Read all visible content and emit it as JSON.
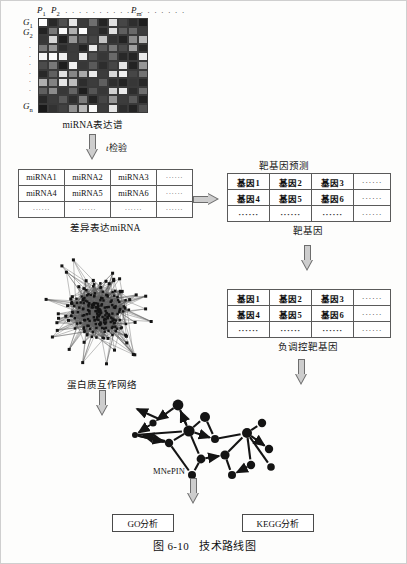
{
  "figure": {
    "caption_number": "图 6-10",
    "caption_title": "技术路线图"
  },
  "heatmap": {
    "name": "miRNA expression heatmap",
    "caption": "miRNA表达谱",
    "col_first": "P",
    "col_first_sub": "1",
    "col_second": "P",
    "col_second_sub": "2",
    "col_last": "P",
    "col_last_sub": "m",
    "row_first": "G",
    "row_first_sub": "1",
    "row_second": "G",
    "row_second_sub": "2",
    "row_last": "G",
    "row_last_sub": "n",
    "col_dots": "· · · · · · · · · · · · · · · · · ·",
    "row_dots": "·",
    "rows": 11,
    "cols": 11,
    "cells": [
      [
        255,
        40,
        80,
        230,
        60,
        110,
        35,
        225,
        70,
        45,
        30
      ],
      [
        35,
        120,
        250,
        175,
        255,
        60,
        40,
        225,
        95,
        105,
        60
      ],
      [
        55,
        215,
        30,
        150,
        90,
        70,
        195,
        50,
        35,
        140,
        185
      ],
      [
        120,
        150,
        45,
        60,
        35,
        235,
        90,
        120,
        75,
        160,
        40
      ],
      [
        245,
        250,
        240,
        60,
        235,
        80,
        55,
        105,
        40,
        35,
        235
      ],
      [
        75,
        120,
        30,
        240,
        55,
        90,
        45,
        70,
        230,
        35,
        150
      ],
      [
        40,
        95,
        225,
        135,
        170,
        235,
        60,
        215,
        240,
        70,
        115
      ],
      [
        175,
        130,
        230,
        190,
        45,
        60,
        95,
        45,
        35,
        55,
        40
      ],
      [
        95,
        140,
        55,
        100,
        30,
        85,
        55,
        210,
        235,
        45,
        110
      ],
      [
        40,
        60,
        90,
        45,
        125,
        35,
        70,
        150,
        60,
        90,
        35
      ],
      [
        25,
        50,
        65,
        145,
        185,
        250,
        60,
        230,
        45,
        35,
        80
      ]
    ]
  },
  "step_labels": {
    "t_test_italic": "t",
    "t_test_rest": "检验",
    "target_prediction": "靶基因预测"
  },
  "mirna_table": {
    "caption": "差异表达miRNA",
    "dots": "······",
    "rows": [
      [
        "miRNA1",
        "miRNA2",
        "miRNA3",
        "······"
      ],
      [
        "miRNA4",
        "miRNA5",
        "miRNA6",
        "······"
      ],
      [
        "······",
        "······",
        "······",
        "······"
      ]
    ]
  },
  "gene_table_1": {
    "caption": "靶基因",
    "rows": [
      [
        "基因1",
        "基因2",
        "基因3",
        "······"
      ],
      [
        "基因4",
        "基因5",
        "基因6",
        "······"
      ],
      [
        "······",
        "······",
        "······",
        "······"
      ]
    ]
  },
  "gene_table_2": {
    "caption": "负调控靶基因",
    "rows": [
      [
        "基因1",
        "基因2",
        "基因3",
        "······"
      ],
      [
        "基因4",
        "基因5",
        "基因6",
        "······"
      ],
      [
        "······",
        "······",
        "······",
        "······"
      ]
    ]
  },
  "ppi_network": {
    "caption": "蛋白质互作网络"
  },
  "mnepin_network": {
    "caption": "MNePIN"
  },
  "outcomes": {
    "go": "GO分析",
    "kegg": "KEGG分析"
  },
  "colors": {
    "line": "#5a5a5a",
    "arrow_fill": "#cdcdcd",
    "arrow_stroke": "#6d6d6d",
    "network_node": "#141414",
    "page_bg": "#fdfdfc"
  }
}
